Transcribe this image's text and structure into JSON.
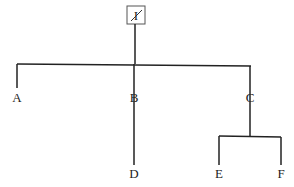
{
  "diagram": {
    "type": "tree",
    "root": {
      "label": "I",
      "boxed": true,
      "struck": true
    },
    "nodes": [
      {
        "id": "A",
        "label": "A",
        "struck": false
      },
      {
        "id": "B",
        "label": "B",
        "struck": true
      },
      {
        "id": "C",
        "label": "C",
        "struck": true
      },
      {
        "id": "D",
        "label": "D",
        "struck": false
      },
      {
        "id": "E",
        "label": "E",
        "struck": false
      },
      {
        "id": "F",
        "label": "F",
        "struck": false
      }
    ],
    "edges": [
      [
        "I",
        "A"
      ],
      [
        "I",
        "B"
      ],
      [
        "I",
        "C"
      ],
      [
        "B",
        "D"
      ],
      [
        "C",
        "E"
      ],
      [
        "C",
        "F"
      ]
    ],
    "colors": {
      "line": "#222222",
      "box": "#555555",
      "background": "#ffffff"
    }
  }
}
